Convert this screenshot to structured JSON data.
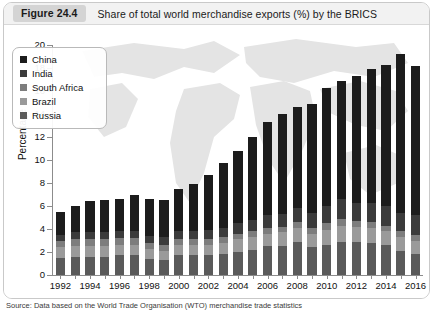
{
  "figure": {
    "badge": "Figure 24.4",
    "title": "Share of total world merchandise exports (%) by the BRICS",
    "source_note": "Source: Data based on the World Trade Organisation (WTO) merchandise trade statistics"
  },
  "legend": {
    "position": "top-left-inside",
    "items": [
      {
        "label": "China",
        "color": "#1c1c1c"
      },
      {
        "label": "India",
        "color": "#3b3b3b"
      },
      {
        "label": "South Africa",
        "color": "#7d7d7d"
      },
      {
        "label": "Brazil",
        "color": "#9a9a9a"
      },
      {
        "label": "Russia",
        "color": "#5a5a5a"
      }
    ]
  },
  "axes": {
    "ylabel": "Percentage",
    "yticks": [
      0,
      2,
      4,
      6,
      8,
      10,
      12,
      14,
      16,
      18,
      20
    ],
    "ylim": [
      0,
      20
    ],
    "xtick_labels": [
      "1992",
      "1994",
      "1996",
      "1998",
      "2000",
      "2002",
      "2004",
      "2006",
      "2008",
      "2010",
      "2012",
      "2014",
      "2016"
    ],
    "grid": false
  },
  "chart_data": {
    "type": "bar",
    "stacked": true,
    "title": "Share of total world merchandise exports (%) by the BRICS",
    "xlabel": "",
    "ylabel": "Percentage",
    "ylim": [
      0,
      20
    ],
    "categories": [
      "1992",
      "1993",
      "1994",
      "1995",
      "1996",
      "1997",
      "1998",
      "1999",
      "2000",
      "2001",
      "2002",
      "2003",
      "2004",
      "2005",
      "2006",
      "2007",
      "2008",
      "2009",
      "2010",
      "2011",
      "2012",
      "2013",
      "2014",
      "2015",
      "2016"
    ],
    "series": [
      {
        "name": "Russia",
        "color": "#5a5a5a",
        "values": [
          1.5,
          1.6,
          1.6,
          1.6,
          1.7,
          1.7,
          1.4,
          1.3,
          1.7,
          1.7,
          1.7,
          1.8,
          2.0,
          2.2,
          2.5,
          2.5,
          2.9,
          2.4,
          2.6,
          2.9,
          2.9,
          2.8,
          2.6,
          2.1,
          1.8
        ]
      },
      {
        "name": "Brazil",
        "color": "#9a9a9a",
        "values": [
          0.9,
          0.9,
          0.9,
          0.9,
          0.9,
          0.9,
          0.9,
          0.8,
          0.9,
          0.9,
          0.9,
          1.0,
          1.1,
          1.1,
          1.1,
          1.2,
          1.2,
          1.2,
          1.3,
          1.4,
          1.3,
          1.3,
          1.2,
          1.2,
          1.2
        ]
      },
      {
        "name": "South Africa",
        "color": "#7d7d7d",
        "values": [
          0.6,
          0.6,
          0.6,
          0.6,
          0.6,
          0.6,
          0.5,
          0.5,
          0.5,
          0.5,
          0.5,
          0.5,
          0.5,
          0.5,
          0.5,
          0.5,
          0.5,
          0.5,
          0.6,
          0.6,
          0.5,
          0.5,
          0.5,
          0.5,
          0.5
        ]
      },
      {
        "name": "India",
        "color": "#3b3b3b",
        "values": [
          0.5,
          0.6,
          0.6,
          0.6,
          0.6,
          0.6,
          0.6,
          0.7,
          0.7,
          0.7,
          0.8,
          0.8,
          0.9,
          1.0,
          1.1,
          1.1,
          1.2,
          1.3,
          1.5,
          1.7,
          1.6,
          1.7,
          1.7,
          1.6,
          1.7
        ]
      },
      {
        "name": "China",
        "color": "#1c1c1c",
        "values": [
          2.0,
          2.3,
          2.7,
          2.8,
          2.8,
          3.2,
          3.2,
          3.2,
          3.7,
          4.1,
          4.8,
          5.6,
          6.3,
          7.2,
          8.1,
          8.7,
          8.8,
          9.5,
          10.3,
          10.3,
          11.0,
          11.6,
          12.3,
          13.8,
          13.0
        ]
      }
    ],
    "totals": [
      5.5,
      6.0,
      6.4,
      6.5,
      6.6,
      7.0,
      6.6,
      6.5,
      7.5,
      7.9,
      8.7,
      9.7,
      10.8,
      12.0,
      13.3,
      14.0,
      14.6,
      14.9,
      16.3,
      16.9,
      17.3,
      17.9,
      18.3,
      19.2,
      18.2
    ]
  }
}
